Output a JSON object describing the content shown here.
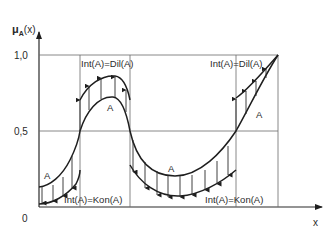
{
  "diagram": {
    "y_axis_label": "μ_Ã(x)",
    "y_axis_label_main": "μ",
    "y_axis_label_sub": "A",
    "y_axis_label_arg": "(x)",
    "x_axis_label": "x",
    "ticks": {
      "one": "1,0",
      "half": "0,5",
      "zero": "0"
    },
    "region_labels": {
      "left_bottom": "Int(A)=Kon(A)",
      "mid_top": "Int(A)=Dil(A)",
      "mid_bottom": "Int(A)=Kon(A)",
      "right_top": "Int(A)=Dil(A)"
    },
    "curve_label": "A",
    "colors": {
      "line": "#1e1e1e",
      "grid": "#6a6a6a",
      "background": "#ffffff"
    }
  }
}
